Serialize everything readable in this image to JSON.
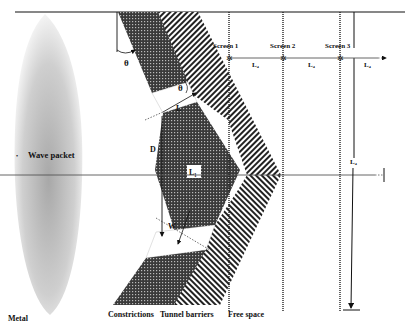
{
  "labels": {
    "wave_packet": "Wave packet",
    "metal": "Metal",
    "constrictions": "Constrictions",
    "tunnel_barriers": "Tunnel barriers",
    "free_space": "Free space",
    "screen1": "Screen 1",
    "screen2": "Screen 2",
    "screen3": "Screen 3",
    "theta_top": "θ",
    "theta_inner": "θ",
    "L": "L",
    "D": "D",
    "W": "W",
    "L1_center": "L₁",
    "L4_a": "L₄",
    "L4_b": "L₄",
    "L4_c": "L₄",
    "L4_vertical": "L₄"
  },
  "colors": {
    "ink": "#111111",
    "constriction_fill": "#2a2a2a",
    "wave_packet": "#bdbdbd",
    "background": "#ffffff"
  }
}
